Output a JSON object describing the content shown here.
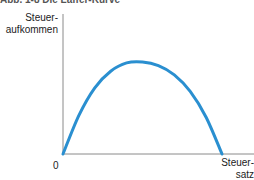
{
  "figure": {
    "title": "Abb. 1-8 Die Laffer-Kurve"
  },
  "chart_data": {
    "type": "line",
    "title": "Die Laffer-Kurve",
    "xlabel": "Steuersatz",
    "ylabel": "Steueraufkommen",
    "ylabel_lines": [
      "Steuer-",
      "aufkommen"
    ],
    "xlabel_lines": [
      "Steuer-",
      "satz"
    ],
    "origin_label": "0",
    "series": [
      {
        "name": "Laffer-Kurve",
        "color": "#2a8fd0",
        "x": [
          0,
          0.1,
          0.2,
          0.3,
          0.4,
          0.5,
          0.6,
          0.7,
          0.8,
          0.9,
          1.0
        ],
        "y": [
          0,
          0.42,
          0.72,
          0.9,
          0.99,
          1.0,
          0.96,
          0.86,
          0.68,
          0.4,
          0
        ]
      }
    ],
    "grid": false,
    "legend": false
  }
}
